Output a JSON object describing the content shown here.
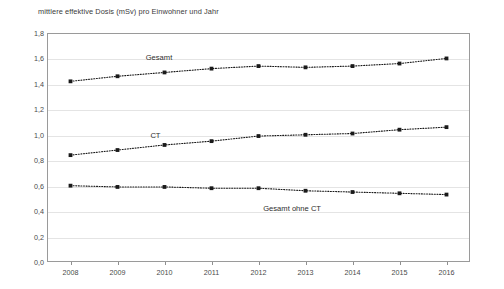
{
  "chart_data": {
    "type": "line",
    "title": "mittlere effektive Dosis (mSv) pro Einwohner und Jahr",
    "xlabel": "",
    "ylabel": "",
    "categories": [
      "2008",
      "2009",
      "2010",
      "2011",
      "2012",
      "2013",
      "2014",
      "2015",
      "2016"
    ],
    "x": [
      2008,
      2009,
      2010,
      2011,
      2012,
      2013,
      2014,
      2015,
      2016
    ],
    "ylim": [
      0.0,
      1.8
    ],
    "ytick_labels": [
      "0,0",
      "0,2",
      "0,4",
      "0,6",
      "0,8",
      "1,0",
      "1,2",
      "1,4",
      "1,6",
      "1,8"
    ],
    "ytick_values": [
      0.0,
      0.2,
      0.4,
      0.6,
      0.8,
      1.0,
      1.2,
      1.4,
      1.6,
      1.8
    ],
    "grid": true,
    "legend_position": "inline-annotations",
    "series": [
      {
        "name": "Gesamt",
        "label": "Gesamt",
        "color": "#1a1a1a",
        "linestyle": "dotted",
        "marker": "square",
        "values": [
          1.42,
          1.46,
          1.49,
          1.52,
          1.54,
          1.53,
          1.54,
          1.56,
          1.6
        ],
        "label_x": 2009.6,
        "label_y": 1.6
      },
      {
        "name": "CT",
        "label": "CT",
        "color": "#1a1a1a",
        "linestyle": "dotted",
        "marker": "square",
        "values": [
          0.84,
          0.88,
          0.92,
          0.95,
          0.99,
          1.0,
          1.01,
          1.04,
          1.06
        ],
        "label_x": 2009.7,
        "label_y": 0.99
      },
      {
        "name": "Gesamt ohne CT",
        "label": "Gesamt ohne CT",
        "color": "#1a1a1a",
        "linestyle": "dotted",
        "marker": "square",
        "values": [
          0.6,
          0.59,
          0.59,
          0.58,
          0.58,
          0.56,
          0.55,
          0.54,
          0.53
        ],
        "label_x": 2012.1,
        "label_y": 0.42
      }
    ]
  }
}
